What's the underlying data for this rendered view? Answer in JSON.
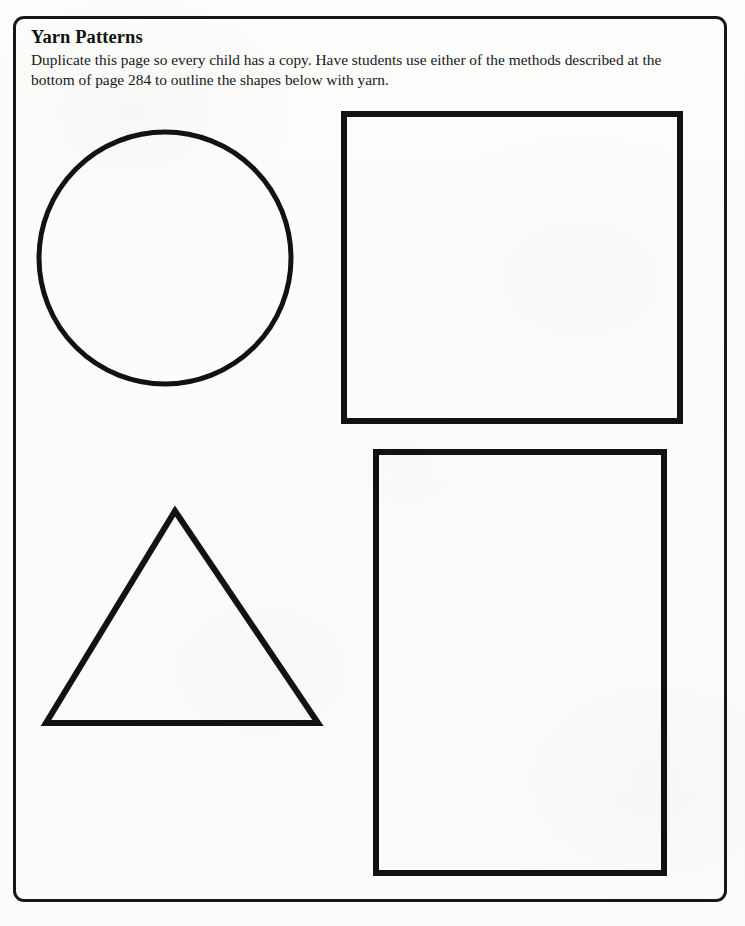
{
  "document": {
    "type": "worksheet",
    "page_background": "#fdfdfc",
    "ink_color": "#121215",
    "border": {
      "name": "page-border",
      "style": "rounded-rectangle",
      "color": "#17171a",
      "stroke_width_px": 3,
      "corner_radius_px": 11,
      "x": 13,
      "y": 16,
      "width": 714,
      "height": 886
    }
  },
  "header": {
    "title": "Yarn Patterns",
    "instructions": "Duplicate this page so every child has a copy. Have students use either of the methods described at the bottom of page 284 to outline the shapes below with yarn.",
    "referenced_page_number": "284"
  },
  "shapes": [
    {
      "id": "circle",
      "name": "circle-shape",
      "label": "Circle",
      "type": "circle",
      "stroke_width_px": 5,
      "center_x": 165,
      "center_y": 258,
      "radius": 126
    },
    {
      "id": "square",
      "name": "square-shape",
      "label": "Square",
      "type": "rectangle",
      "stroke_width_px": 6,
      "x": 344,
      "y": 114,
      "width": 336,
      "height": 307
    },
    {
      "id": "triangle",
      "name": "triangle-shape",
      "label": "Triangle",
      "type": "triangle",
      "stroke_width_px": 6,
      "points": "175,511 318,723 46,723"
    },
    {
      "id": "rectangle",
      "name": "rectangle-shape",
      "label": "Rectangle",
      "type": "rectangle",
      "stroke_width_px": 6,
      "x": 376,
      "y": 452,
      "width": 288,
      "height": 421
    }
  ]
}
